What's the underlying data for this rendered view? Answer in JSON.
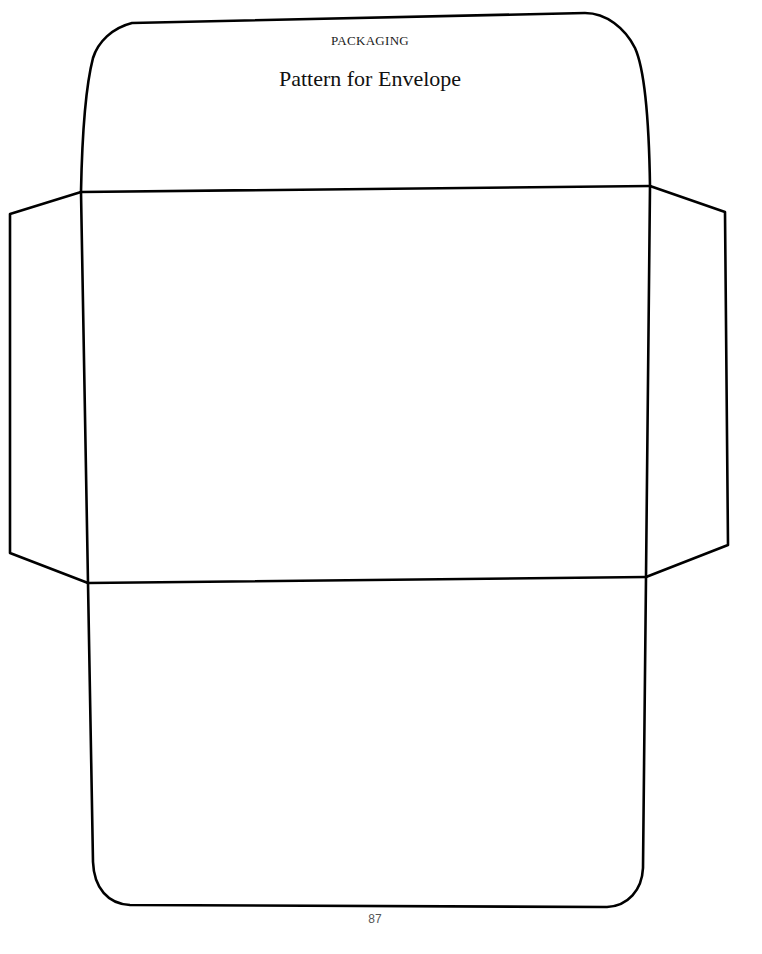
{
  "header": {
    "section": "PACKAGING",
    "title": "Pattern for Envelope"
  },
  "footer": {
    "page_number": "87"
  },
  "pattern": {
    "stroke_color": "#000000",
    "parts": [
      "top-flap",
      "left-side-flap",
      "body-panel",
      "right-side-flap",
      "bottom-flap"
    ]
  }
}
